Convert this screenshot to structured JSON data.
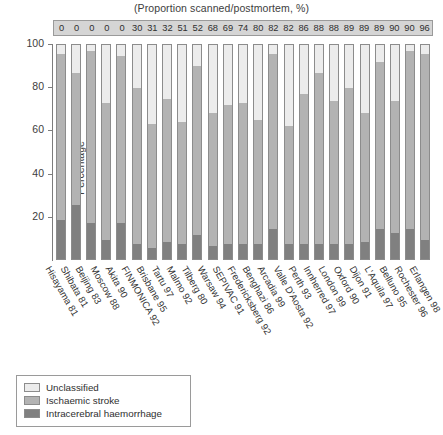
{
  "chart_data": {
    "type": "bar",
    "subtype": "stacked-percentage",
    "title": "(Proportion scanned/postmortem, %)",
    "xlabel": "",
    "ylabel": "Percentage",
    "ylim": [
      0,
      100
    ],
    "yticks": [
      20,
      40,
      60,
      80,
      100
    ],
    "grid": false,
    "legend_position": "bottom-left",
    "categories": [
      "Hisayama 81",
      "Shibata 81",
      "Beijing 83",
      "Moscow 88",
      "Akita 90",
      "FINMONICA 92",
      "Brisbane 95",
      "Tartu 97",
      "Malmo 92",
      "Tilberg 80",
      "Warsaw 94",
      "SEPIVAC 91",
      "Fredericksberg 92",
      "Benghazi 86",
      "Arcadia 99",
      "Valle D'Aosta 92",
      "Perth 93",
      "Innherred 97",
      "London 99",
      "Oxford 90",
      "Dijon 91",
      "L'Aquila 97",
      "Belluno 95",
      "Rochester 96",
      "Erlangen 98"
    ],
    "proportion_scanned": [
      0,
      0,
      0,
      0,
      0,
      30,
      31,
      32,
      51,
      52,
      68,
      69,
      74,
      80,
      82,
      82,
      86,
      88,
      88,
      89,
      89,
      89,
      90,
      90,
      96
    ],
    "series": [
      {
        "name": "Unclassified",
        "color": "#ececec",
        "values": [
          4,
          13,
          3,
          27,
          5,
          20,
          37,
          25,
          36,
          10,
          32,
          28,
          27,
          35,
          4,
          38,
          23,
          13,
          26,
          20,
          32,
          8,
          26,
          3,
          4
        ]
      },
      {
        "name": "Ischaemic stroke",
        "color": "#b3b3b3",
        "values": [
          78,
          62,
          80,
          64,
          78,
          73,
          58,
          67,
          57,
          79,
          62,
          65,
          66,
          58,
          82,
          55,
          70,
          80,
          67,
          73,
          60,
          78,
          62,
          83,
          87
        ]
      },
      {
        "name": "Intracerebral haemorrhage",
        "color": "#808080",
        "values": [
          18,
          25,
          17,
          9,
          17,
          7,
          5,
          8,
          7,
          11,
          6,
          7,
          7,
          7,
          14,
          7,
          7,
          7,
          7,
          7,
          8,
          14,
          12,
          14,
          9
        ]
      }
    ]
  },
  "legend": {
    "items": [
      {
        "label": "Unclassified",
        "color": "#ececec"
      },
      {
        "label": "Ischaemic stroke",
        "color": "#b3b3b3"
      },
      {
        "label": "Intracerebral haemorrhage",
        "color": "#808080"
      }
    ]
  }
}
